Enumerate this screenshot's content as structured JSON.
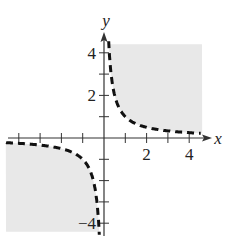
{
  "chart_data": {
    "type": "line",
    "title": "",
    "xlabel": "x",
    "ylabel": "y",
    "xlim": [
      -4.6,
      4.6
    ],
    "ylim": [
      -4.6,
      4.6
    ],
    "x_ticks": [
      -4,
      -3,
      -2,
      -1,
      1,
      2,
      3,
      4
    ],
    "y_ticks": [
      -4,
      -3,
      -2,
      -1,
      1,
      2,
      3,
      4
    ],
    "x_tick_labels": [
      {
        "value": 2,
        "label": "2"
      },
      {
        "value": 4,
        "label": "4"
      }
    ],
    "y_tick_labels": [
      {
        "value": 4,
        "label": "4"
      },
      {
        "value": 2,
        "label": "2"
      },
      {
        "value": -4,
        "label": "−4"
      }
    ],
    "grid": false,
    "legend": null,
    "series": [
      {
        "name": "boundary y = 1/x",
        "style": "dashed",
        "color": "#111111",
        "x": [
          0.22,
          0.25,
          0.3,
          0.4,
          0.5,
          0.75,
          1,
          1.5,
          2,
          3,
          4,
          4.5
        ],
        "y": [
          4.5,
          4,
          3.33,
          2.5,
          2,
          1.33,
          1,
          0.67,
          0.5,
          0.33,
          0.25,
          0.22
        ]
      },
      {
        "name": "boundary y = 1/x (negative branch)",
        "style": "dashed",
        "color": "#111111",
        "x": [
          -4.6,
          -4,
          -3,
          -2,
          -1.5,
          -1,
          -0.75,
          -0.5,
          -0.4,
          -0.3,
          -0.25,
          -0.22
        ],
        "y": [
          -0.22,
          -0.25,
          -0.33,
          -0.5,
          -0.67,
          -1,
          -1.33,
          -2,
          -2.5,
          -3.33,
          -4,
          -4.5
        ]
      }
    ],
    "shaded_regions": [
      {
        "quadrant": "I",
        "description": "region above y=1/x for x>0",
        "color": "#e6e6e6"
      },
      {
        "quadrant": "III",
        "description": "region below y=1/x for x<0",
        "color": "#e6e6e6"
      }
    ]
  },
  "labels": {
    "x_axis": "x",
    "y_axis": "y"
  },
  "colors": {
    "shade": "#e8e8e8",
    "axis": "#333333",
    "curve": "#111111"
  }
}
